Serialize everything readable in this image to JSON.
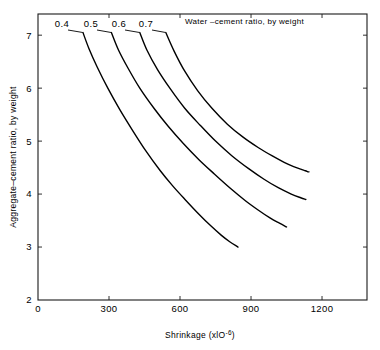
{
  "chart_data": {
    "type": "line",
    "title": "",
    "xlabel": "Shrinkage (x10⁻⁶)",
    "xlabel_base": "Shrinkage  (xlO",
    "xlabel_exp": "-6",
    "xlabel_close": ")",
    "ylabel": "Aggregate–cement ratio, by weight",
    "legend_title": "Water –cement ratio, by weight",
    "legend_position": "top-inside-right",
    "grid": false,
    "xlim": [
      0,
      1390
    ],
    "ylim": [
      2,
      7.4
    ],
    "xticks": [
      0,
      300,
      600,
      900,
      1200
    ],
    "xtick_labels": [
      "0",
      "300",
      "600",
      "900",
      "1200"
    ],
    "yticks": [
      2,
      3,
      4,
      5,
      6,
      7
    ],
    "ytick_labels": [
      "2",
      "3",
      "4",
      "5",
      "6",
      "7"
    ],
    "series": [
      {
        "name": "0.4",
        "label": "0.4",
        "color": "#000000",
        "x": [
          190,
          215,
          250,
          295,
          345,
          400,
          455,
          515,
          570,
          625,
          680,
          730,
          775,
          810,
          845
        ],
        "y": [
          7.05,
          6.75,
          6.4,
          6.0,
          5.6,
          5.2,
          4.82,
          4.45,
          4.15,
          3.88,
          3.62,
          3.4,
          3.22,
          3.1,
          3.0
        ]
      },
      {
        "name": "0.5",
        "label": "0.5",
        "color": "#000000",
        "x": [
          310,
          340,
          380,
          430,
          490,
          550,
          615,
          680,
          745,
          810,
          875,
          930,
          980,
          1020,
          1050
        ],
        "y": [
          7.05,
          6.72,
          6.38,
          6.0,
          5.62,
          5.28,
          4.95,
          4.65,
          4.38,
          4.12,
          3.88,
          3.7,
          3.55,
          3.45,
          3.38
        ]
      },
      {
        "name": "0.6",
        "label": "0.6",
        "color": "#000000",
        "x": [
          430,
          460,
          505,
          560,
          620,
          685,
          750,
          820,
          890,
          955,
          1015,
          1070,
          1110,
          1130,
          1130
        ],
        "y": [
          7.05,
          6.72,
          6.35,
          5.98,
          5.62,
          5.3,
          5.0,
          4.72,
          4.48,
          4.28,
          4.12,
          4.0,
          3.93,
          3.9,
          3.9
        ]
      },
      {
        "name": "0.7",
        "label": "0.7",
        "color": "#000000",
        "x": [
          540,
          575,
          620,
          675,
          735,
          800,
          865,
          930,
          990,
          1040,
          1080,
          1110,
          1130,
          1140,
          1145
        ],
        "y": [
          7.05,
          6.7,
          6.32,
          5.95,
          5.62,
          5.32,
          5.08,
          4.88,
          4.72,
          4.6,
          4.52,
          4.47,
          4.44,
          4.42,
          4.42
        ]
      }
    ]
  },
  "geometry": {
    "plot_left": 38,
    "plot_right": 367,
    "plot_top": 14,
    "plot_bottom": 300
  }
}
